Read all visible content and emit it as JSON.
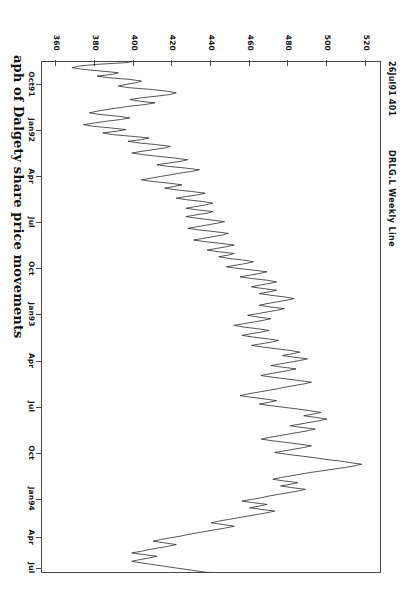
{
  "document": {
    "kind": "scanned-figure",
    "orientation": "rotated-90",
    "caption": "aph of Dalgety share price movements"
  },
  "header": {
    "title": "DRLG.L  Weekly  Line",
    "quote_stamp": "26Jul91  401"
  },
  "chart_data": {
    "type": "line",
    "title": "DRLG.L  Weekly  Line",
    "subtitle": "26Jul91  401",
    "xlabel": "",
    "ylabel": "",
    "grid": false,
    "legend": "none",
    "series_name": "DRLG.L",
    "ylim": [
      352,
      528
    ],
    "yticks": [
      520,
      500,
      480,
      460,
      440,
      420,
      400,
      380,
      360
    ],
    "ytick_labels": [
      "520",
      "500",
      "480",
      "460",
      "440",
      "420",
      "400",
      "380",
      "360"
    ],
    "xticks": [
      "Oct91",
      "Jan92",
      "Apr",
      "Jul",
      "Oct",
      "Jan93",
      "Apr",
      "Jul",
      "Oct",
      "Jan94",
      "Apr",
      "Jul"
    ],
    "xtick_labels": [
      "Oct91",
      "Jan92",
      "Apr",
      "Jul",
      "Oct",
      "Jan93",
      "Apr",
      "Jul",
      "Oct",
      "Jan94",
      "Apr",
      "Jul"
    ],
    "xtick_positions": [
      0.045,
      0.135,
      0.225,
      0.315,
      0.405,
      0.495,
      0.585,
      0.675,
      0.765,
      0.855,
      0.93,
      0.99
    ],
    "x_start_label": "26Jul91",
    "x_end_label": "Jul",
    "values": [
      401,
      396,
      381,
      372,
      368,
      374,
      383,
      392,
      389,
      381,
      387,
      398,
      404,
      401,
      396,
      392,
      398,
      409,
      417,
      422,
      419,
      412,
      404,
      398,
      403,
      411,
      406,
      398,
      392,
      386,
      381,
      377,
      383,
      392,
      398,
      393,
      386,
      380,
      374,
      379,
      388,
      396,
      391,
      384,
      389,
      399,
      408,
      404,
      397,
      403,
      412,
      419,
      416,
      410,
      404,
      399,
      405,
      413,
      421,
      428,
      424,
      418,
      412,
      418,
      427,
      434,
      430,
      424,
      419,
      414,
      409,
      404,
      410,
      418,
      425,
      421,
      416,
      422,
      430,
      437,
      433,
      427,
      422,
      428,
      436,
      441,
      437,
      432,
      427,
      433,
      441,
      438,
      432,
      427,
      433,
      440,
      447,
      443,
      438,
      433,
      428,
      434,
      442,
      449,
      446,
      441,
      436,
      431,
      437,
      445,
      452,
      448,
      443,
      438,
      444,
      452,
      449,
      444,
      449,
      457,
      462,
      458,
      453,
      448,
      454,
      462,
      469,
      465,
      460,
      455,
      461,
      469,
      474,
      470,
      465,
      461,
      467,
      474,
      470,
      465,
      471,
      478,
      483,
      479,
      474,
      469,
      465,
      471,
      478,
      474,
      469,
      464,
      459,
      464,
      471,
      467,
      462,
      457,
      452,
      457,
      464,
      470,
      466,
      461,
      456,
      462,
      469,
      475,
      471,
      466,
      461,
      467,
      474,
      481,
      486,
      482,
      477,
      483,
      490,
      486,
      481,
      476,
      471,
      477,
      484,
      480,
      475,
      470,
      466,
      472,
      479,
      486,
      492,
      488,
      483,
      478,
      474,
      469,
      464,
      459,
      455,
      461,
      468,
      474,
      470,
      465,
      471,
      478,
      485,
      491,
      497,
      493,
      488,
      494,
      500,
      496,
      491,
      486,
      481,
      487,
      494,
      490,
      485,
      480,
      475,
      470,
      466,
      472,
      479,
      486,
      492,
      488,
      483,
      478,
      473,
      479,
      486,
      493,
      499,
      506,
      512,
      518,
      514,
      509,
      503,
      497,
      491,
      486,
      481,
      476,
      472,
      478,
      485,
      481,
      476,
      482,
      489,
      485,
      480,
      475,
      470,
      466,
      461,
      456,
      462,
      469,
      465,
      460,
      466,
      473,
      469,
      464,
      459,
      454,
      449,
      444,
      440,
      446,
      452,
      448,
      443,
      438,
      433,
      428,
      424,
      419,
      414,
      410,
      416,
      422,
      418,
      413,
      408,
      404,
      399,
      405,
      412,
      408,
      403,
      399,
      404,
      410,
      416,
      422,
      428,
      434,
      440
    ]
  },
  "axes": {
    "value_ticks": [
      "520",
      "500",
      "480",
      "460",
      "440",
      "420",
      "400",
      "380",
      "360"
    ],
    "time_ticks": [
      "Oct91",
      "Jan92",
      "Apr",
      "Jul",
      "Oct",
      "Jan93",
      "Apr",
      "Jul",
      "Oct",
      "Jan94",
      "Apr",
      "Jul"
    ]
  }
}
